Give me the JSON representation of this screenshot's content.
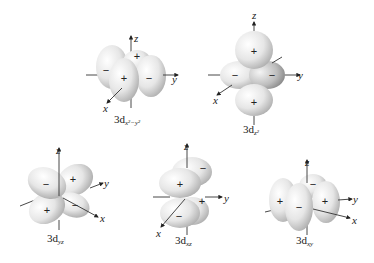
{
  "figure": {
    "orbitals": [
      {
        "id": "dx2y2",
        "label_main": "3d",
        "label_sub": "x²−y²",
        "lobes": [
          "+",
          "−",
          "+",
          "−"
        ]
      },
      {
        "id": "dz2",
        "label_main": "3d",
        "label_sub": "z²",
        "lobes": [
          "+",
          "−",
          "−",
          "+"
        ]
      },
      {
        "id": "dyz",
        "label_main": "3d",
        "label_sub": "yz",
        "lobes": [
          "−",
          "+",
          "+",
          "−"
        ]
      },
      {
        "id": "dxz",
        "label_main": "3d",
        "label_sub": "xz",
        "lobes": [
          "+",
          "−",
          "+",
          "−"
        ]
      },
      {
        "id": "dxy",
        "label_main": "3d",
        "label_sub": "xy",
        "lobes": [
          "+",
          "−",
          "−",
          "+"
        ]
      }
    ],
    "axes": {
      "x": "x",
      "y": "y",
      "z": "z"
    },
    "signs": {
      "plus": "+",
      "minus": "−"
    }
  }
}
